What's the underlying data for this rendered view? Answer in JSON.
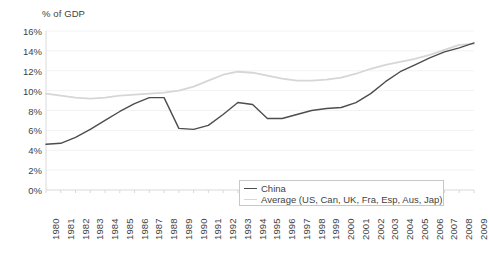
{
  "chart_data": {
    "type": "line",
    "title": "",
    "axis_note": "% of GDP",
    "xlabel": "",
    "ylabel": "% of GDP",
    "grid": true,
    "legend_position": "bottom-right",
    "xlim": [
      1980,
      2009
    ],
    "ylim": [
      0,
      16
    ],
    "ytick_step": 2,
    "categories": [
      "1980",
      "1981",
      "1982",
      "1983",
      "1984",
      "1985",
      "1986",
      "1987",
      "1988",
      "1989",
      "1990",
      "1991",
      "1992",
      "1993",
      "1994",
      "1995",
      "1996",
      "1997",
      "1998",
      "1999",
      "2000",
      "2001",
      "2002",
      "2003",
      "2004",
      "2005",
      "2006",
      "2007",
      "2008",
      "2009"
    ],
    "ytick_labels": [
      "0%",
      "2%",
      "4%",
      "6%",
      "8%",
      "10%",
      "12%",
      "14%",
      "16%"
    ],
    "ytick_values": [
      0,
      2,
      4,
      6,
      8,
      10,
      12,
      14,
      16
    ],
    "series": [
      {
        "name": "China",
        "color": "#4d4d4d",
        "values": [
          4.6,
          4.7,
          5.3,
          6.1,
          7.0,
          7.9,
          8.7,
          9.3,
          9.3,
          6.2,
          6.1,
          6.5,
          7.6,
          8.8,
          8.6,
          7.2,
          7.2,
          7.6,
          8.0,
          8.2,
          8.3,
          8.8,
          9.7,
          10.9,
          11.9,
          12.6,
          13.3,
          13.9,
          14.3,
          14.8
        ]
      },
      {
        "name": "Average (US, Can, UK, Fra, Esp, Aus, Jap)",
        "color": "#d6d6d6",
        "values": [
          9.7,
          9.5,
          9.3,
          9.2,
          9.3,
          9.5,
          9.6,
          9.7,
          9.8,
          10.0,
          10.4,
          11.0,
          11.6,
          11.9,
          11.8,
          11.5,
          11.2,
          11.0,
          11.0,
          11.1,
          11.3,
          11.7,
          12.2,
          12.6,
          12.9,
          13.2,
          13.6,
          14.1,
          14.6,
          14.7
        ]
      }
    ]
  },
  "legend": {
    "items": [
      {
        "label": "China"
      },
      {
        "label": "Average (US, Can, UK, Fra, Esp, Aus, Jap)"
      }
    ]
  },
  "colors": {
    "china_line": "#4d4d4d",
    "average_line": "#d6d6d6",
    "grid": "#f2f2f2",
    "axis": "#d9d9d9",
    "text": "#3f3f3f"
  }
}
